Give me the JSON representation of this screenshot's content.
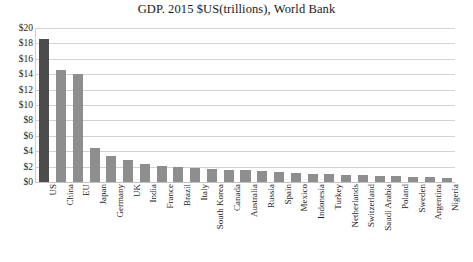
{
  "chart_data": {
    "type": "bar",
    "title": "GDP. 2015 $US(trillions), World Bank",
    "xlabel": "",
    "ylabel": "",
    "ylim": [
      0,
      20
    ],
    "ytick_labels": [
      "$20",
      "$18",
      "$16",
      "$14",
      "$12",
      "$10",
      "$8",
      "$6",
      "$4",
      "$2",
      "$0"
    ],
    "ytick_values": [
      20,
      18,
      16,
      14,
      12,
      10,
      8,
      6,
      4,
      2,
      0
    ],
    "grid": true,
    "legend": false,
    "highlight_category": "US",
    "colors": {
      "bar": "#8e8e8e",
      "bar_highlight": "#4c4c4c",
      "gridline": "#d2d2d2",
      "text": "#1d1d1d",
      "background": "#ffffff"
    },
    "categories": [
      "US",
      "China",
      "EU",
      "Japan",
      "Germany",
      "UK",
      "India",
      "France",
      "Brazil",
      "Italy",
      "South Korea",
      "Canada",
      "Australia",
      "Russia",
      "Spain",
      "Mexico",
      "Indonesia",
      "Turkey",
      "Netherlands",
      "Switzerland",
      "Saudi Arabia",
      "Poland",
      "Sweden",
      "Argentina",
      "Nigeria"
    ],
    "values": [
      18.6,
      14.6,
      14.0,
      4.4,
      3.4,
      2.9,
      2.4,
      2.1,
      1.9,
      1.8,
      1.7,
      1.6,
      1.5,
      1.4,
      1.3,
      1.2,
      1.1,
      1.0,
      0.9,
      0.85,
      0.8,
      0.75,
      0.7,
      0.6,
      0.5
    ]
  }
}
